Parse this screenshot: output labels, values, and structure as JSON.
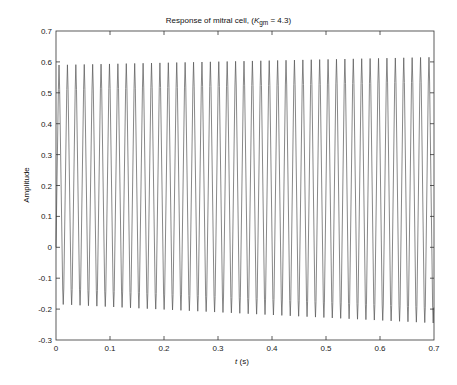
{
  "chart_data": {
    "type": "line",
    "title_parts": {
      "prefix": "Response of mitral cell, (",
      "var": "K",
      "sub": "gm",
      "suffix": " = 4.3)"
    },
    "xlabel": "t (s)",
    "xlabel_parts": {
      "var": "t",
      "unit": " (s)"
    },
    "ylabel": "Amplitude",
    "xlim": [
      0,
      0.7
    ],
    "ylim": [
      -0.3,
      0.7
    ],
    "xticks": [
      0,
      0.1,
      0.2,
      0.3,
      0.4,
      0.5,
      0.6,
      0.7
    ],
    "xtick_labels": [
      "0",
      "0.1",
      "0.2",
      "0.3",
      "0.4",
      "0.5",
      "0.6",
      "0.7"
    ],
    "yticks": [
      -0.3,
      -0.2,
      -0.1,
      0,
      0.1,
      0.2,
      0.3,
      0.4,
      0.5,
      0.6,
      0.7
    ],
    "ytick_labels": [
      "-0.3",
      "-0.2",
      "-0.1",
      "0",
      "0.1",
      "0.2",
      "0.3",
      "0.4",
      "0.5",
      "0.6",
      "0.7"
    ],
    "grid": false,
    "legend": null,
    "line_color": "#555555",
    "series": [
      {
        "name": "mitral cell response",
        "description": "Periodic spike-like oscillation, ~45 cycles over 0.7 s (period ≈ 0.0156 s, ≈64 Hz). Peaks grow slightly from ≈0.59 to ≈0.615; troughs deepen from ≈-0.185 to ≈-0.245.",
        "start": {
          "t": 0,
          "y": 0.0
        },
        "period": 0.01557,
        "first_peak_t": 0.0056,
        "trough_offset": 0.0078,
        "n_cycles": 45,
        "peak_start": 0.59,
        "peak_end": 0.615,
        "trough_start": -0.185,
        "trough_end": -0.245
      }
    ]
  }
}
